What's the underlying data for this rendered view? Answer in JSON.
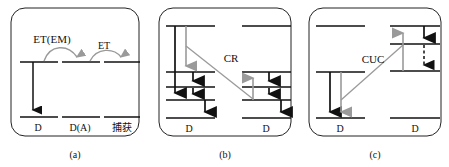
{
  "figure": {
    "name": "energy-transfer-mechanism-diagram",
    "width": 449,
    "height": 167,
    "background": "#ffffff",
    "line_color": "#111111",
    "transfer_arrow_color": "#9a9a9a",
    "border_color": "#222222"
  },
  "panels": [
    {
      "id": "a",
      "caption": "(a)",
      "process_labels": [
        {
          "text": "ET(EM)",
          "x": 52,
          "y": 43
        },
        {
          "text": "ET",
          "x": 101,
          "y": 48
        }
      ],
      "ion_labels": [
        {
          "text": "D",
          "x": 38,
          "y": 130
        },
        {
          "text": "D(A)",
          "x": 77,
          "y": 130
        },
        {
          "text": "捕获",
          "x": 121,
          "y": 130
        }
      ],
      "levels": [
        {
          "site": 1,
          "kind": "excited",
          "x1": 20,
          "x2": 58,
          "y": 62
        },
        {
          "site": 1,
          "kind": "ground",
          "x1": 20,
          "x2": 58,
          "y": 117
        },
        {
          "site": 2,
          "kind": "excited",
          "x1": 62,
          "x2": 100,
          "y": 62
        },
        {
          "site": 2,
          "kind": "ground",
          "x1": 62,
          "x2": 100,
          "y": 117
        },
        {
          "site": 3,
          "kind": "excited",
          "x1": 104,
          "x2": 140,
          "y": 62
        },
        {
          "site": 3,
          "kind": "ground",
          "x1": 104,
          "x2": 140,
          "y": 117
        }
      ],
      "emission_arrows": [
        {
          "x": 33,
          "y1": 62,
          "y2": 115,
          "dir": "down",
          "color": "#111111"
        }
      ],
      "curved_transfers": [
        {
          "from_x": 44,
          "to_x": 78,
          "y": 62,
          "label": "ET(EM)"
        },
        {
          "from_x": 90,
          "to_x": 122,
          "y": 62,
          "label": "ET"
        }
      ]
    },
    {
      "id": "b",
      "caption": "(b)",
      "process_labels": [
        {
          "text": "CR",
          "x": 228,
          "y": 61
        }
      ],
      "ion_labels": [
        {
          "text": "D",
          "x": 189,
          "y": 131
        },
        {
          "text": "D",
          "x": 265,
          "y": 131
        }
      ],
      "levels": [
        {
          "site": "left",
          "x1": 166,
          "x2": 215,
          "y": 26
        },
        {
          "site": "left",
          "x1": 166,
          "x2": 215,
          "y": 72
        },
        {
          "site": "left",
          "x1": 166,
          "x2": 215,
          "y": 87
        },
        {
          "site": "left",
          "x1": 166,
          "x2": 215,
          "y": 100
        },
        {
          "site": "left",
          "x1": 166,
          "x2": 215,
          "y": 118
        },
        {
          "site": "right",
          "x1": 242,
          "x2": 291,
          "y": 26
        },
        {
          "site": "right",
          "x1": 242,
          "x2": 291,
          "y": 72
        },
        {
          "site": "right",
          "x1": 242,
          "x2": 291,
          "y": 87
        },
        {
          "site": "right",
          "x1": 242,
          "x2": 291,
          "y": 100
        },
        {
          "site": "right",
          "x1": 242,
          "x2": 291,
          "y": 118
        }
      ],
      "black_arrows": [
        {
          "x": 175,
          "y1": 26,
          "y2": 98,
          "dir": "down"
        },
        {
          "x": 192,
          "y1": 72,
          "y2": 86,
          "dir": "down"
        },
        {
          "x": 192,
          "y1": 87,
          "y2": 99,
          "dir": "down"
        },
        {
          "x": 203,
          "y1": 100,
          "y2": 117,
          "dir": "down"
        },
        {
          "x": 268,
          "y1": 72,
          "y2": 86,
          "dir": "down"
        },
        {
          "x": 268,
          "y1": 87,
          "y2": 99,
          "dir": "down"
        },
        {
          "x": 279,
          "y1": 100,
          "y2": 117,
          "dir": "down"
        }
      ],
      "gray_arrows": [
        {
          "x": 186,
          "y1": 26,
          "y2": 71,
          "dir": "down"
        },
        {
          "x": 253,
          "y1": 100,
          "y2": 73,
          "dir": "up"
        }
      ],
      "cross_relax_line": {
        "x1": 186,
        "y1": 46,
        "x2": 253,
        "y2": 99,
        "label": "CR"
      }
    },
    {
      "id": "c",
      "caption": "(c)",
      "process_labels": [
        {
          "text": "CUC",
          "x": 371,
          "y": 62
        }
      ],
      "ion_labels": [
        {
          "text": "D",
          "x": 340,
          "y": 131
        },
        {
          "text": "D",
          "x": 415,
          "y": 131
        }
      ],
      "levels": [
        {
          "site": "left",
          "x1": 316,
          "x2": 365,
          "y": 26
        },
        {
          "site": "left",
          "x1": 316,
          "x2": 365,
          "y": 72
        },
        {
          "site": "left",
          "x1": 316,
          "x2": 365,
          "y": 118
        },
        {
          "site": "right",
          "x1": 390,
          "x2": 440,
          "y": 26
        },
        {
          "site": "right",
          "x1": 390,
          "x2": 440,
          "y": 44
        },
        {
          "site": "right",
          "x1": 390,
          "x2": 440,
          "y": 71
        },
        {
          "site": "right",
          "x1": 390,
          "x2": 440,
          "y": 118
        }
      ],
      "black_arrows": [
        {
          "x": 330,
          "y1": 72,
          "y2": 116,
          "dir": "down"
        },
        {
          "x": 424,
          "y1": 26,
          "y2": 43,
          "dir": "down"
        }
      ],
      "gray_arrows": [
        {
          "x": 341,
          "y1": 72,
          "y2": 116,
          "dir": "down"
        },
        {
          "x": 403,
          "y1": 71,
          "y2": 27,
          "dir": "up"
        }
      ],
      "dashed_arrows": [
        {
          "x": 424,
          "y1": 44,
          "y2": 70,
          "dir": "down"
        }
      ],
      "cross_relax_line": {
        "x1": 341,
        "y1": 100,
        "x2": 403,
        "y2": 45,
        "label": "CUC"
      }
    }
  ]
}
